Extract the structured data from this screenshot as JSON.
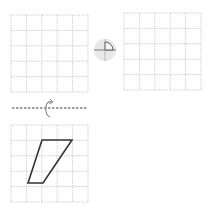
{
  "diagram": {
    "grids": [
      {
        "name": "top-left-grid",
        "x": 11,
        "y": 15,
        "cols": 5,
        "rows": 5,
        "cell": 15.4
      },
      {
        "name": "top-right-grid",
        "x": 124,
        "y": 13,
        "cols": 5,
        "rows": 5,
        "cell": 15.4
      },
      {
        "name": "bottom-grid",
        "x": 11,
        "y": 125,
        "cols": 5,
        "rows": 5,
        "cell": 15.4
      }
    ],
    "shape": {
      "type": "trapezoid",
      "grid": "bottom-grid",
      "vertices_grid": [
        [
          2,
          1
        ],
        [
          4,
          1
        ],
        [
          2,
          4
        ],
        [
          1,
          4
        ]
      ],
      "stroke": "#333333"
    },
    "rotation_icon": {
      "type": "quarter-turn",
      "center": [
        105,
        50
      ],
      "radius": 11
    },
    "reflection_line": {
      "y": 108,
      "x1": 12,
      "x2": 88,
      "style": "dashed"
    },
    "colors": {
      "grid": "#bdbdbd",
      "shape": "#333333",
      "icon_bg": "#e6e6e6",
      "icon_stroke": "#555555"
    }
  }
}
